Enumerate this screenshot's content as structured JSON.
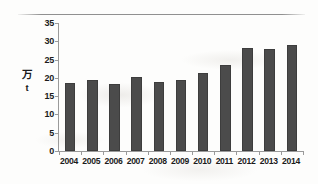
{
  "chart_data": {
    "type": "bar",
    "title": "",
    "subtitle": "",
    "xlabel": "",
    "ylabel": "万 t",
    "ylabel_lines": [
      "万",
      "t"
    ],
    "categories": [
      "2004",
      "2005",
      "2006",
      "2007",
      "2008",
      "2009",
      "2010",
      "2011",
      "2012",
      "2013",
      "2014"
    ],
    "values": [
      18.5,
      19.5,
      18.3,
      20.2,
      19.0,
      19.3,
      21.3,
      23.6,
      28.2,
      28.0,
      28.9
    ],
    "series": [
      {
        "name": "",
        "values": [
          18.5,
          19.5,
          18.3,
          20.2,
          19.0,
          19.3,
          21.3,
          23.6,
          28.2,
          28.0,
          28.9
        ]
      }
    ],
    "ylim": [
      0,
      35
    ],
    "yticks": [
      0,
      5,
      10,
      15,
      20,
      25,
      30,
      35
    ],
    "ytick_labels": [
      "0",
      "5",
      "10",
      "15",
      "20",
      "25",
      "30",
      "35"
    ],
    "grid": false,
    "legend": false,
    "legend_position": "none",
    "bar_color": "#4b4b4b",
    "axis_color": "#9a9a9a",
    "text_color": "#1b1b1b",
    "background_color": "#fdfdfc",
    "annotations": []
  }
}
